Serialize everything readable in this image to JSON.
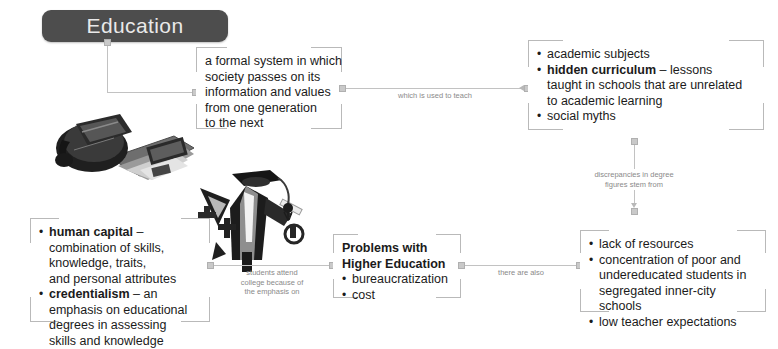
{
  "map": {
    "title": "Education",
    "title_color": "#4d4d4d",
    "line_color": "#c2c2c2",
    "label_color": "#8a8a8a",
    "text_color": "#1b1b1b"
  },
  "nodes": {
    "definition": {
      "lines": [
        "a formal system in which",
        "society passes on its",
        "information and values",
        "from one generation",
        "to the next"
      ]
    },
    "curriculum": {
      "items": [
        {
          "bullet": true,
          "term": "",
          "rest": "academic subjects"
        },
        {
          "bullet": true,
          "term": "hidden curriculum",
          "rest": " – lessons"
        },
        {
          "bullet": false,
          "term": "",
          "rest": "taught in schools that are unrelated"
        },
        {
          "bullet": false,
          "term": "",
          "rest": "to academic learning"
        },
        {
          "bullet": true,
          "term": "",
          "rest": "social myths"
        }
      ]
    },
    "capital": {
      "items": [
        {
          "bullet": true,
          "term": "human capital",
          "rest": " –"
        },
        {
          "bullet": false,
          "term": "",
          "rest": "combination of skills,"
        },
        {
          "bullet": false,
          "term": "",
          "rest": "knowledge, traits,"
        },
        {
          "bullet": false,
          "term": "",
          "rest": "and personal attributes"
        },
        {
          "bullet": true,
          "term": "credentialism",
          "rest": " – an"
        },
        {
          "bullet": false,
          "term": "",
          "rest": "emphasis on educational"
        },
        {
          "bullet": false,
          "term": "",
          "rest": "degrees in assessing"
        },
        {
          "bullet": false,
          "term": "",
          "rest": "skills and knowledge"
        }
      ]
    },
    "problems": {
      "heading_lines": [
        "Problems with",
        "Higher Education"
      ],
      "items": [
        {
          "bullet": true,
          "term": "",
          "rest": "bureaucratization"
        },
        {
          "bullet": true,
          "term": "",
          "rest": "cost"
        }
      ]
    },
    "inequality": {
      "items": [
        {
          "bullet": true,
          "term": "",
          "rest": "lack of resources"
        },
        {
          "bullet": true,
          "term": "",
          "rest": "concentration of poor and"
        },
        {
          "bullet": false,
          "term": "",
          "rest": "undereducated students in"
        },
        {
          "bullet": false,
          "term": "",
          "rest": "segregated inner-city schools"
        },
        {
          "bullet": true,
          "term": "",
          "rest": "low teacher expectations"
        }
      ]
    }
  },
  "connector_labels": {
    "is": "is",
    "teach": "which is used to teach",
    "discrepancies": "discrepancies in degree\nfigures stem from",
    "students_attend": "students attend\ncollege because of\nthe emphasis on",
    "there_are_also": "there are also"
  },
  "photos": {
    "backpack": "backpack-with-books-photo",
    "graduation": "graduation-cap-and-gown-photo"
  }
}
